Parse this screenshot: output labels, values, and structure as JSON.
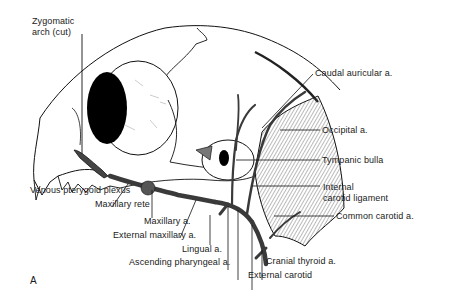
{
  "figure": {
    "panel_label": "A",
    "colors": {
      "line": "#111111",
      "fill": "#ffffff",
      "hatch": "#555555",
      "vessel": "#3a3a3a"
    },
    "labels": {
      "zygomatic_arch": "Zygomatic\narch (cut)",
      "caudal_auricular": "Caudal auricular a.",
      "occipital": "Occipital a.",
      "tympanic_bulla": "Tympanic bulla",
      "internal_carotid_ligament": "Internal\ncarotid ligament",
      "common_carotid": "Common carotid a.",
      "venous_pterygoid_plexus": "Venous pterygoid plexus",
      "maxillary_rete": "Maxillary rete",
      "maxillary_a": "Maxillary a.",
      "external_maxillary": "External maxillary a.",
      "lingual": "Lingual a.",
      "ascending_pharyngeal": "Ascending pharyngeal a.",
      "cranial_thyroid": "Cranial thyroid a.",
      "external_carotid": "External carotid"
    }
  }
}
